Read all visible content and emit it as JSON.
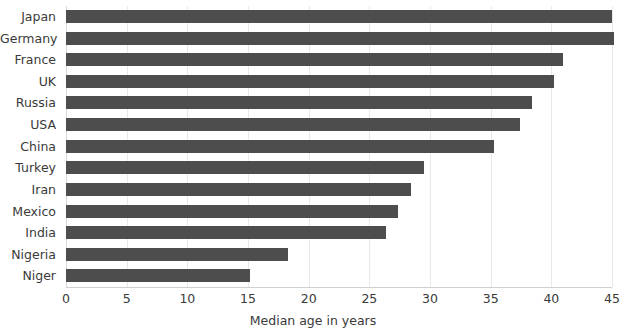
{
  "chart_data": {
    "type": "bar",
    "orientation": "horizontal",
    "title": "",
    "xlabel": "Median age in years",
    "ylabel": "",
    "xlim": [
      0,
      45
    ],
    "xticks": [
      0,
      5,
      10,
      15,
      20,
      25,
      30,
      35,
      40,
      45
    ],
    "xtick_labels": [
      "0",
      "5",
      "10",
      "15",
      "20",
      "25",
      "30",
      "35",
      "40",
      "45"
    ],
    "grid": true,
    "grid_axis": "x",
    "legend": false,
    "bar_color": "#4d4d4d",
    "categories": [
      "Japan",
      "Germany",
      "France",
      "UK",
      "Russia",
      "USA",
      "China",
      "Turkey",
      "Iran",
      "Mexico",
      "India",
      "Nigeria",
      "Niger"
    ],
    "values": [
      45.0,
      45.2,
      41.0,
      40.2,
      38.4,
      37.4,
      35.3,
      29.5,
      28.4,
      27.4,
      26.4,
      18.3,
      15.2
    ]
  }
}
